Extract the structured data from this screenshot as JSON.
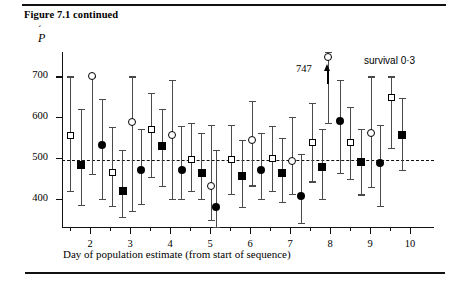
{
  "figure": {
    "caption": "Figure 7.1 continued",
    "y_axis_symbol": "P",
    "y_axis_accent": "́",
    "x_axis_title": "Day of population estimate (from start of sequence)",
    "annotation_747": "747",
    "annotation_survival": "survival 0·3",
    "rule_top": "horizontal-rule",
    "rule_bottom": "horizontal-rule"
  },
  "chart_data": {
    "type": "scatter",
    "title": "Figure 7.1 continued",
    "xlabel": "Day of population estimate (from start of sequence)",
    "ylabel": "Ṕ",
    "xlim": [
      1.3,
      10.6
    ],
    "ylim": [
      330,
      760
    ],
    "yticks": [
      400,
      500,
      600,
      700
    ],
    "xticks_major": [
      2,
      3,
      4,
      5,
      6,
      7,
      8,
      9,
      10
    ],
    "xticks_minor": [
      1.5,
      2.5,
      3.5,
      4.5,
      5.5,
      6.5,
      7.5,
      8.5,
      9.5
    ],
    "grid": false,
    "legend": "none",
    "reference_line": {
      "value": 495,
      "style": "dashed",
      "label": ""
    },
    "annotations": [
      {
        "text": "747",
        "x": 7.95,
        "y": 747,
        "note": "open circle with upward arrow, value off scale"
      },
      {
        "text": "survival 0·3",
        "x": 9.6,
        "y": 735
      }
    ],
    "marker_styles": {
      "open-square": "open square",
      "filled-square": "filled square",
      "open-circle": "open circle",
      "filled-circle": "filled circle"
    },
    "points": [
      {
        "x": 1.5,
        "y": 556,
        "lo": 418,
        "hi": 700,
        "marker": "open-square"
      },
      {
        "x": 1.78,
        "y": 482,
        "lo": 385,
        "hi": 620,
        "marker": "filled-square"
      },
      {
        "x": 2.05,
        "y": 700,
        "lo": 460,
        "hi": 700,
        "marker": "open-circle"
      },
      {
        "x": 2.3,
        "y": 532,
        "lo": 398,
        "hi": 645,
        "marker": "filled-circle"
      },
      {
        "x": 2.56,
        "y": 463,
        "lo": 382,
        "hi": 575,
        "marker": "open-square"
      },
      {
        "x": 2.82,
        "y": 418,
        "lo": 355,
        "hi": 520,
        "marker": "filled-square"
      },
      {
        "x": 3.05,
        "y": 588,
        "lo": 370,
        "hi": 700,
        "marker": "open-circle"
      },
      {
        "x": 3.28,
        "y": 470,
        "lo": 386,
        "hi": 570,
        "marker": "filled-circle"
      },
      {
        "x": 3.54,
        "y": 570,
        "lo": 452,
        "hi": 660,
        "marker": "open-square"
      },
      {
        "x": 3.8,
        "y": 530,
        "lo": 430,
        "hi": 620,
        "marker": "filled-square"
      },
      {
        "x": 4.05,
        "y": 557,
        "lo": 398,
        "hi": 692,
        "marker": "open-circle"
      },
      {
        "x": 4.29,
        "y": 470,
        "lo": 400,
        "hi": 578,
        "marker": "filled-circle"
      },
      {
        "x": 4.54,
        "y": 495,
        "lo": 418,
        "hi": 585,
        "marker": "open-square"
      },
      {
        "x": 4.79,
        "y": 462,
        "lo": 398,
        "hi": 560,
        "marker": "filled-square"
      },
      {
        "x": 5.03,
        "y": 430,
        "lo": 348,
        "hi": 580,
        "marker": "open-circle"
      },
      {
        "x": 5.16,
        "y": 378,
        "lo": 330,
        "hi": 520,
        "marker": "filled-circle"
      },
      {
        "x": 5.54,
        "y": 495,
        "lo": 412,
        "hi": 580,
        "marker": "open-square"
      },
      {
        "x": 5.8,
        "y": 455,
        "lo": 380,
        "hi": 545,
        "marker": "filled-square"
      },
      {
        "x": 6.05,
        "y": 545,
        "lo": 432,
        "hi": 640,
        "marker": "open-circle"
      },
      {
        "x": 6.28,
        "y": 470,
        "lo": 400,
        "hi": 562,
        "marker": "filled-circle"
      },
      {
        "x": 6.55,
        "y": 498,
        "lo": 418,
        "hi": 578,
        "marker": "open-square"
      },
      {
        "x": 6.8,
        "y": 462,
        "lo": 392,
        "hi": 548,
        "marker": "filled-square"
      },
      {
        "x": 7.05,
        "y": 492,
        "lo": 412,
        "hi": 600,
        "marker": "open-circle"
      },
      {
        "x": 7.28,
        "y": 405,
        "lo": 340,
        "hi": 510,
        "marker": "filled-circle"
      },
      {
        "x": 7.56,
        "y": 537,
        "lo": 442,
        "hi": 635,
        "marker": "open-square"
      },
      {
        "x": 7.8,
        "y": 478,
        "lo": 400,
        "hi": 572,
        "marker": "filled-square"
      },
      {
        "x": 7.96,
        "y": 747,
        "lo": 585,
        "hi": 760,
        "marker": "open-circle"
      },
      {
        "x": 8.25,
        "y": 590,
        "lo": 462,
        "hi": 692,
        "marker": "filled-circle"
      },
      {
        "x": 8.52,
        "y": 537,
        "lo": 448,
        "hi": 625,
        "marker": "open-square"
      },
      {
        "x": 8.78,
        "y": 490,
        "lo": 410,
        "hi": 570,
        "marker": "filled-square"
      },
      {
        "x": 9.03,
        "y": 562,
        "lo": 428,
        "hi": 700,
        "marker": "open-circle"
      },
      {
        "x": 9.26,
        "y": 488,
        "lo": 382,
        "hi": 580,
        "marker": "filled-circle"
      },
      {
        "x": 9.53,
        "y": 648,
        "lo": 525,
        "hi": 700,
        "marker": "open-square"
      },
      {
        "x": 9.8,
        "y": 555,
        "lo": 470,
        "hi": 648,
        "marker": "filled-square"
      }
    ]
  }
}
